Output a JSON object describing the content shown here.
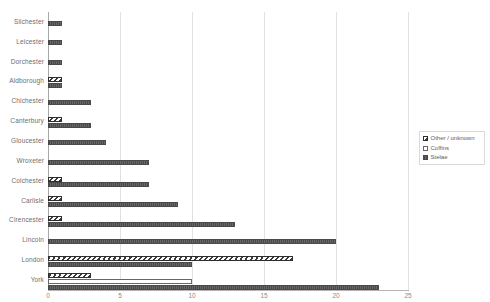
{
  "chart_data": {
    "type": "bar",
    "orientation": "horizontal",
    "title": "",
    "subtitle": "",
    "xlabel": "",
    "ylabel": "",
    "xlim": [
      0,
      25
    ],
    "xticks": [
      "0",
      "5",
      "10",
      "15",
      "20",
      "25"
    ],
    "grid": "vertical",
    "legend_position": "right",
    "categories": [
      "Silchester",
      "Leicester",
      "Dorchester",
      "Aldborough",
      "Chichester",
      "Canterbury",
      "Gloucester",
      "Wroxeter",
      "Colchester",
      "Carlisle",
      "Cirencester",
      "Lincoln",
      "London",
      "York"
    ],
    "series": [
      {
        "name": "Other / unknown",
        "values": [
          0,
          0,
          0,
          1,
          0,
          1,
          0,
          0,
          1,
          1,
          1,
          0,
          17,
          3
        ]
      },
      {
        "name": "Coffins",
        "values": [
          0,
          0,
          0,
          0,
          0,
          0,
          0,
          0,
          0,
          0,
          0,
          0,
          0,
          10
        ]
      },
      {
        "name": "Stelae",
        "values": [
          1,
          1,
          1,
          1,
          3,
          3,
          4,
          7,
          7,
          9,
          13,
          20,
          10,
          23
        ]
      }
    ]
  },
  "legend": {
    "items": [
      {
        "label": "Other / unknown",
        "key": "other"
      },
      {
        "label": "Coffins",
        "key": "coffins"
      },
      {
        "label": "Stelae",
        "key": "stelae"
      }
    ]
  },
  "colors": {
    "stelae": "#595959",
    "coffins": "#ffffff",
    "other": "#3a3a3a",
    "gridline": "#e2e2e2",
    "axis": "#a8a8a8",
    "text": "#6d6d6d"
  }
}
